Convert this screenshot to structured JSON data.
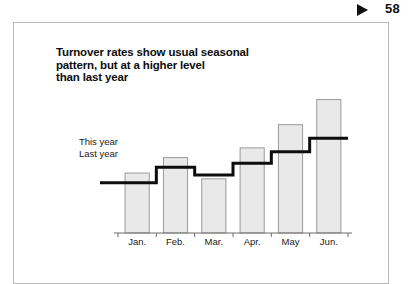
{
  "page": {
    "folio_number": "58",
    "marker_icon": "play-triangle-icon"
  },
  "exhibit": {
    "title_lines": [
      "Turnover rates show usual seasonal",
      "pattern, but at a higher level",
      "than last year"
    ],
    "legend": {
      "this_year": "This year",
      "last_year": "Last year"
    },
    "colors": {
      "bar_fill": "#e9e9e9",
      "bar_stroke": "#9a9a9a",
      "step_line": "#0d0d0d",
      "axis": "#6f6f6f",
      "frame": "#b9b9b9",
      "text": "#111111"
    }
  },
  "chart_data": {
    "type": "bar",
    "title": "Turnover rates show usual seasonal pattern, but at a higher level than last year",
    "xlabel": "",
    "ylabel": "Turnover rate",
    "categories": [
      "Jan.",
      "Feb.",
      "Mar.",
      "Apr.",
      "May",
      "Jun."
    ],
    "series": [
      {
        "name": "This year",
        "type": "bar",
        "values": [
          3.1,
          3.9,
          2.8,
          4.4,
          5.6,
          6.9
        ]
      },
      {
        "name": "Last year",
        "type": "step",
        "values": [
          2.6,
          3.4,
          3.0,
          3.6,
          4.2,
          4.9
        ]
      }
    ],
    "ylim": [
      0,
      7.6
    ],
    "grid": false,
    "legend_position": "left-inline"
  }
}
